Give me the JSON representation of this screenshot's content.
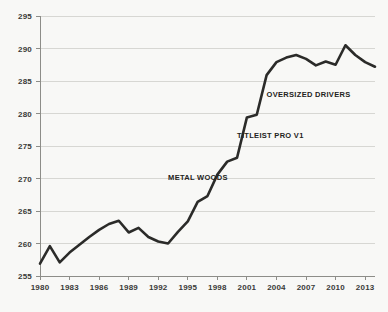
{
  "chart_data": {
    "type": "line",
    "title": "",
    "subtitle": "",
    "xlabel": "",
    "ylabel": "",
    "xlim": [
      1980,
      2014
    ],
    "ylim": [
      255,
      295
    ],
    "grid": true,
    "legend_position": "none",
    "x_tick_labels": [
      "1980",
      "1983",
      "1986",
      "1989",
      "1992",
      "1995",
      "1998",
      "2001",
      "2004",
      "2007",
      "2010",
      "2013"
    ],
    "x_tick_values": [
      1980,
      1983,
      1986,
      1989,
      1992,
      1995,
      1998,
      2001,
      2004,
      2007,
      2010,
      2013
    ],
    "y_tick_labels": [
      "255",
      "260",
      "265",
      "270",
      "275",
      "280",
      "285",
      "290",
      "295"
    ],
    "y_tick_values": [
      255,
      260,
      265,
      270,
      275,
      280,
      285,
      290,
      295
    ],
    "series": [
      {
        "name": "Average Driving Distance",
        "color": "#2b2b29",
        "x": [
          1980,
          1981,
          1982,
          1983,
          1984,
          1985,
          1986,
          1987,
          1988,
          1989,
          1990,
          1991,
          1992,
          1993,
          1994,
          1995,
          1996,
          1997,
          1998,
          1999,
          2000,
          2001,
          2002,
          2003,
          2004,
          2005,
          2006,
          2007,
          2008,
          2009,
          2010,
          2011,
          2012,
          2013,
          2014
        ],
        "values": [
          256.9,
          259.6,
          257.1,
          258.6,
          259.8,
          261.0,
          262.1,
          263.0,
          263.5,
          261.7,
          262.4,
          261.0,
          260.3,
          260.0,
          261.8,
          263.4,
          266.4,
          267.3,
          270.6,
          272.6,
          273.2,
          279.4,
          279.8,
          285.9,
          287.9,
          288.6,
          289.0,
          288.4,
          287.4,
          288.0,
          287.5,
          290.5,
          289.0,
          287.9,
          287.2
        ]
      }
    ],
    "annotations": [
      {
        "text": "METAL WOODS",
        "year": 1993,
        "value": 269.8
      },
      {
        "text": "TITLEIST PRO V1",
        "year": 2000,
        "value": 276.3
      },
      {
        "text": "OVERSIZED DRIVERS",
        "year": 2003,
        "value": 282.6
      }
    ]
  }
}
